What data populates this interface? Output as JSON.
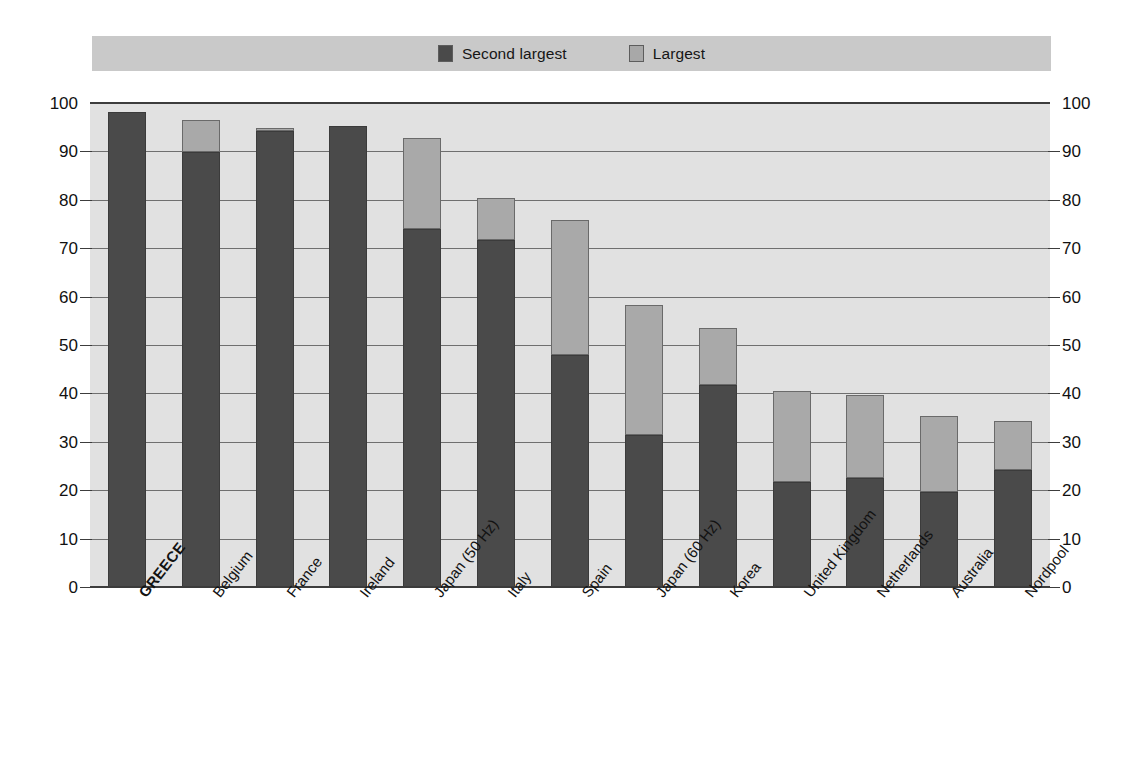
{
  "legend": {
    "entries": [
      {
        "label": "Second largest",
        "swatch": "dark",
        "color": "#4a4a4a"
      },
      {
        "label": "Largest",
        "swatch": "light",
        "color": "#a9a9a9"
      }
    ]
  },
  "axes": {
    "left_ticks": [
      "100",
      "90",
      "80",
      "70",
      "60",
      "50",
      "40",
      "30",
      "20",
      "10",
      "0"
    ],
    "right_ticks": [
      "100",
      "90",
      "80",
      "70",
      "60",
      "50",
      "40",
      "30",
      "20",
      "10",
      "0"
    ]
  },
  "chart_data": {
    "type": "bar",
    "subtype": "stacked-vertical",
    "title": "",
    "xlabel": "",
    "ylabel": "",
    "ylim": [
      0,
      100
    ],
    "ytick_step": 10,
    "grid": true,
    "legend_position": "top",
    "highlight_category": "GREECE",
    "categories": [
      "GREECE",
      "Belgium",
      "France",
      "Ireland",
      "Japan (50 Hz)",
      "Italy",
      "Spain",
      "Japan (60 Hz)",
      "Korea",
      "United Kingdom",
      "Netherlands",
      "Australia",
      "Nordpool"
    ],
    "series": [
      {
        "name": "Second largest",
        "color": "#4a4a4a",
        "values": [
          98.2,
          89.8,
          94.3,
          95.2,
          74.0,
          71.8,
          47.9,
          31.5,
          41.8,
          21.8,
          22.5,
          19.7,
          24.2
        ]
      },
      {
        "name": "Largest",
        "color": "#a9a9a9",
        "values": [
          0.0,
          6.7,
          0.6,
          0.0,
          18.8,
          8.6,
          27.9,
          26.8,
          11.8,
          18.8,
          17.1,
          15.7,
          10.1
        ]
      }
    ],
    "totals": [
      98.2,
      96.5,
      94.9,
      95.2,
      92.8,
      80.4,
      75.8,
      58.3,
      53.6,
      40.6,
      39.6,
      35.4,
      34.3
    ]
  }
}
